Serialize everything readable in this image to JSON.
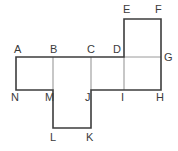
{
  "figure": {
    "type": "geometric-net",
    "stroke_outer_color": "#3d3d3d",
    "stroke_inner_color": "#8f8f8f",
    "background_color": "#ffffff",
    "label_color": "#3b3b3b"
  },
  "vertices": [
    {
      "id": "A",
      "label": "A",
      "x": 14,
      "y": 44
    },
    {
      "id": "B",
      "label": "B",
      "x": 50,
      "y": 44
    },
    {
      "id": "C",
      "label": "C",
      "x": 87,
      "y": 44
    },
    {
      "id": "D",
      "label": "D",
      "x": 113,
      "y": 44
    },
    {
      "id": "E",
      "label": "E",
      "x": 123,
      "y": 4
    },
    {
      "id": "F",
      "label": "F",
      "x": 155,
      "y": 4
    },
    {
      "id": "G",
      "label": "G",
      "x": 164,
      "y": 52
    },
    {
      "id": "H",
      "label": "H",
      "x": 156,
      "y": 92
    },
    {
      "id": "I",
      "label": "I",
      "x": 121,
      "y": 92
    },
    {
      "id": "J",
      "label": "J",
      "x": 85,
      "y": 92
    },
    {
      "id": "K",
      "label": "K",
      "x": 86,
      "y": 132
    },
    {
      "id": "L",
      "label": "L",
      "x": 50,
      "y": 132
    },
    {
      "id": "M",
      "label": "M",
      "x": 45,
      "y": 92
    },
    {
      "id": "N",
      "label": "N",
      "x": 11,
      "y": 92
    }
  ],
  "geometry": {
    "x_left": 16,
    "x_b": 53,
    "x_c": 91,
    "x_d": 124,
    "x_right": 161,
    "y_top_small": 19,
    "y_row_top": 57,
    "y_row_bottom": 90,
    "y_bottom_small": 128
  },
  "outline_path": "M 16 57 L 124 57 L 124 19 L 161 19 L 161 90 L 91 90 L 91 128 L 53 128 L 53 90 L 16 90 Z",
  "inner_segments": [
    {
      "name": "segment-B-M",
      "x1": 53,
      "y1": 57,
      "x2": 53,
      "y2": 90
    },
    {
      "name": "segment-C-J",
      "x1": 91,
      "y1": 57,
      "x2": 91,
      "y2": 90
    },
    {
      "name": "segment-D-I",
      "x1": 124,
      "y1": 57,
      "x2": 124,
      "y2": 90
    },
    {
      "name": "segment-D-G",
      "x1": 124,
      "y1": 57,
      "x2": 161,
      "y2": 57
    }
  ]
}
